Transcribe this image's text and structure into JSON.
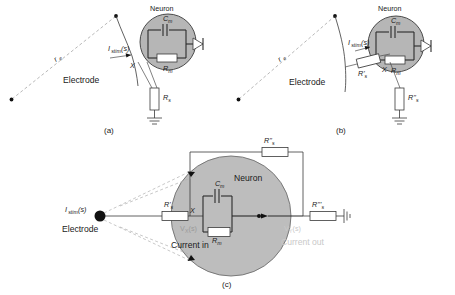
{
  "figure": {
    "title_caption": "",
    "panels": [
      {
        "id": "a",
        "caption": "(a)",
        "labels": {
          "electrode": "Electrode",
          "neuron": "Neuron",
          "distance": "r",
          "distance_sub": "e",
          "stim_current": "I",
          "stim_current_sub": "stim",
          "stim_current_arg": "(s)",
          "node": "X",
          "membrane_cap": "C",
          "membrane_cap_sub": "m",
          "membrane_res": "R",
          "membrane_res_sub": "m",
          "series_res": "R",
          "series_res_sub": "s"
        }
      },
      {
        "id": "b",
        "caption": "(b)",
        "labels": {
          "electrode": "Electrode",
          "neuron": "Neuron",
          "distance": "r",
          "distance_sub": "e",
          "stim_current": "I",
          "stim_current_sub": "stim",
          "stim_current_arg": "(s)",
          "node": "X",
          "membrane_cap": "C",
          "membrane_cap_sub": "m",
          "membrane_res": "R",
          "membrane_res_sub": "m",
          "series_res_1": "R'",
          "series_res_1_sub": "s",
          "series_res_2": "R''",
          "series_res_2_sub": "s"
        }
      },
      {
        "id": "c",
        "caption": "(c)",
        "labels": {
          "electrode": "Electrode",
          "neuron": "Neuron",
          "stim_current": "I",
          "stim_current_sub": "stim",
          "stim_current_arg": "(s)",
          "node_x": "X",
          "node_x_voltage": "V",
          "node_x_voltage_sub": "X",
          "node_x_voltage_arg": "(s)",
          "node_y_voltage": "V",
          "node_y_voltage_sub": "Y",
          "node_y_voltage_arg": "(s)",
          "membrane_cap": "C",
          "membrane_cap_sub": "m",
          "membrane_res": "R",
          "membrane_res_sub": "m",
          "series_res_1": "R'",
          "series_res_1_sub": "s",
          "series_res_2": "R''",
          "series_res_2_sub": "s",
          "series_res_3": "R'''",
          "series_res_3_sub": "s",
          "current_in": "Current in",
          "current_out": "Current out"
        }
      }
    ],
    "colors": {
      "soma_fill": "#b6b6b6",
      "soma_fill_large": "#bdbdbd",
      "wire": "#3a3a3a",
      "dashed_line": "#9a9a9a",
      "faint_text": "#c9c9c9",
      "background": "#ffffff",
      "text": "#1a1a1a"
    }
  }
}
